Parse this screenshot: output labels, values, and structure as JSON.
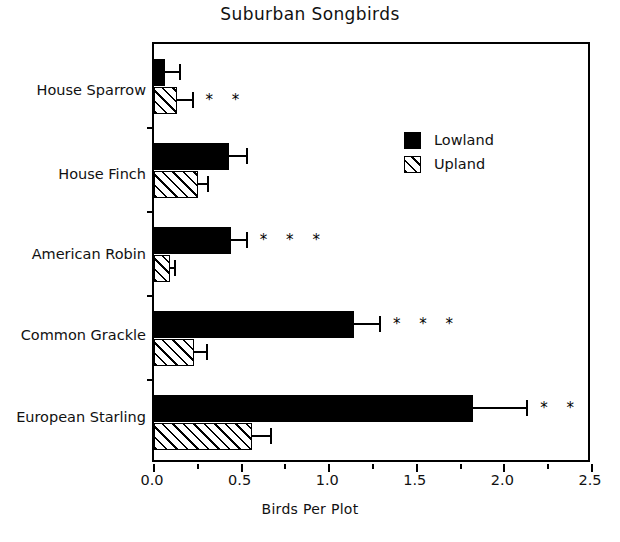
{
  "chart_data": {
    "type": "bar",
    "orientation": "horizontal",
    "title": "Suburban Songbirds",
    "xlabel": "Birds Per Plot",
    "ylabel": "",
    "xlim": [
      0.0,
      2.5
    ],
    "xticks": [
      "0.0",
      "0.5",
      "1.0",
      "1.5",
      "2.0",
      "2.5"
    ],
    "xtick_values": [
      0.0,
      0.5,
      1.0,
      1.5,
      2.0,
      2.5
    ],
    "grid": false,
    "legend_position": "upper right inside",
    "categories": [
      "House Sparrow",
      "House Finch",
      "American Robin",
      "Common Grackle",
      "European Starling"
    ],
    "series": [
      {
        "name": "Lowland",
        "color": "#000000",
        "fill": "solid",
        "values": [
          0.06,
          0.43,
          0.44,
          1.14,
          1.82
        ],
        "errors_upper": [
          0.09,
          0.1,
          0.09,
          0.15,
          0.31
        ]
      },
      {
        "name": "Upland",
        "color": "#000000",
        "fill": "hatched",
        "values": [
          0.13,
          0.25,
          0.09,
          0.23,
          0.56
        ],
        "errors_upper": [
          0.09,
          0.06,
          0.03,
          0.07,
          0.11
        ]
      }
    ],
    "annotations": [
      {
        "category": "House Sparrow",
        "series": "Upland",
        "text": "* *",
        "stars": 2
      },
      {
        "category": "American Robin",
        "series": "Lowland",
        "text": "* * *",
        "stars": 3
      },
      {
        "category": "Common Grackle",
        "series": "Lowland",
        "text": "* * *",
        "stars": 3
      },
      {
        "category": "European Starling",
        "series": "Lowland",
        "text": "* *",
        "stars": 2
      }
    ]
  },
  "legend": {
    "items": [
      {
        "label": "Lowland",
        "fill": "solid"
      },
      {
        "label": "Upland",
        "fill": "hatched"
      }
    ]
  }
}
